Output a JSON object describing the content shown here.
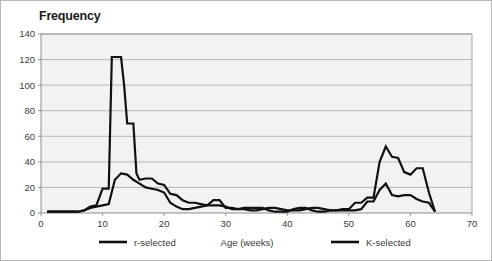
{
  "chart_data": {
    "type": "line",
    "title": "Frequency",
    "xlabel": "Age (weeks)",
    "ylabel": "Frequency",
    "xlim": [
      0,
      70
    ],
    "ylim": [
      0,
      140
    ],
    "xticks": [
      0,
      10,
      20,
      30,
      40,
      50,
      60,
      70
    ],
    "yticks": [
      0,
      20,
      40,
      60,
      80,
      100,
      120,
      140
    ],
    "grid": "horizontal",
    "legend_position": "bottom",
    "line_color": "#111111",
    "plot_background": "#f2f2f2",
    "gridline_color": "#a9a9a9",
    "series": [
      {
        "name": "r-selected",
        "x": [
          1,
          2,
          3,
          4,
          5,
          6,
          7,
          8,
          9,
          10,
          11,
          11.5,
          12,
          13,
          13.5,
          14,
          15,
          15.5,
          16,
          17,
          18,
          19,
          20,
          21,
          22,
          23,
          24,
          25,
          26,
          27,
          28,
          29,
          30,
          31,
          32,
          33,
          34,
          35,
          36,
          37,
          38,
          39,
          40,
          41,
          42,
          43,
          44,
          45,
          46,
          47,
          48,
          49,
          50,
          51,
          52,
          53,
          54,
          55,
          56,
          57,
          58,
          59,
          60,
          61,
          62,
          63,
          64
        ],
        "values": [
          1,
          1,
          1,
          1,
          1,
          1,
          2,
          5,
          6,
          19,
          19,
          122,
          122,
          122,
          100,
          70,
          70,
          31,
          26,
          27,
          27,
          23,
          22,
          15,
          14,
          10,
          8,
          8,
          7,
          6,
          10,
          10,
          4,
          4,
          3,
          4,
          4,
          4,
          4,
          2,
          1,
          1,
          1,
          3,
          4,
          4,
          2,
          1,
          1,
          2,
          2,
          3,
          3,
          8,
          8,
          12,
          12,
          40,
          52,
          44,
          43,
          32,
          30,
          35,
          35,
          16,
          1
        ]
      },
      {
        "name": "K-selected",
        "x": [
          1,
          2,
          3,
          4,
          5,
          6,
          7,
          8,
          9,
          10,
          11,
          12,
          13,
          14,
          15,
          16,
          17,
          18,
          19,
          20,
          21,
          22,
          23,
          24,
          25,
          26,
          27,
          28,
          29,
          30,
          31,
          32,
          33,
          34,
          35,
          36,
          37,
          38,
          39,
          40,
          41,
          42,
          43,
          44,
          45,
          46,
          47,
          48,
          49,
          50,
          51,
          52,
          53,
          54,
          55,
          56,
          57,
          58,
          59,
          60,
          61,
          62,
          63,
          64
        ],
        "values": [
          1,
          1,
          1,
          1,
          1,
          1,
          2,
          4,
          5,
          6,
          7,
          26,
          31,
          30,
          26,
          23,
          20,
          19,
          18,
          16,
          8,
          5,
          3,
          3,
          4,
          5,
          6,
          6,
          6,
          5,
          3,
          3,
          3,
          2,
          2,
          3,
          4,
          4,
          3,
          2,
          2,
          2,
          3,
          4,
          4,
          3,
          2,
          2,
          2,
          2,
          2,
          3,
          9,
          9,
          18,
          23,
          14,
          13,
          14,
          14,
          11,
          9,
          8,
          1
        ]
      }
    ]
  },
  "legend": {
    "items": [
      {
        "label": "r-selected"
      },
      {
        "label": "K-selected"
      }
    ]
  },
  "axis": {
    "x_label": "Age (weeks)"
  }
}
